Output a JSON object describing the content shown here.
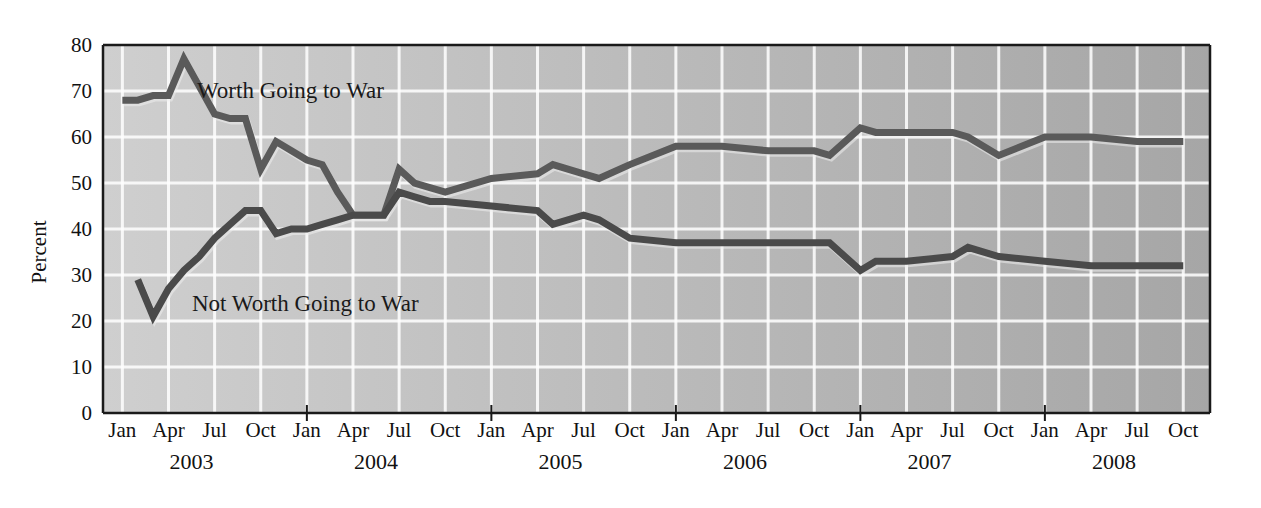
{
  "chart_data": {
    "type": "line",
    "title": "",
    "xlabel": "",
    "ylabel": "Percent",
    "ylim": [
      0,
      80
    ],
    "ytick_step": 10,
    "yticks": [
      "0",
      "10",
      "20",
      "30",
      "40",
      "50",
      "60",
      "70",
      "80"
    ],
    "grid": true,
    "grid_color": "#ffffff",
    "plot_bg_left": "#cfcfcf",
    "plot_bg_right": "#a6a6a6",
    "legend_position": "inline-annotations",
    "x": [
      "Jan 2003",
      "Feb 2003",
      "Mar 2003",
      "Apr 2003",
      "May 2003",
      "Jun 2003",
      "Jul 2003",
      "Aug 2003",
      "Sep 2003",
      "Oct 2003",
      "Nov 2003",
      "Dec 2003",
      "Jan 2004",
      "Feb 2004",
      "Mar 2004",
      "Apr 2004",
      "May 2004",
      "Jun 2004",
      "Jul 2004",
      "Aug 2004",
      "Sep 2004",
      "Oct 2004",
      "Jan 2005",
      "Apr 2005",
      "May 2005",
      "Jul 2005",
      "Aug 2005",
      "Oct 2005",
      "Jan 2006",
      "Apr 2006",
      "Jul 2006",
      "Oct 2006",
      "Nov 2006",
      "Jan 2007",
      "Feb 2007",
      "Apr 2007",
      "Jul 2007",
      "Aug 2007",
      "Oct 2007",
      "Jan 2008",
      "Apr 2008",
      "Jul 2008",
      "Oct 2008"
    ],
    "series": [
      {
        "name": "Worth Going to War",
        "color": "#5a5a5a",
        "values": [
          68,
          68,
          69,
          69,
          77,
          71,
          65,
          64,
          64,
          53,
          59,
          57,
          55,
          54,
          48,
          43,
          43,
          43,
          53,
          50,
          49,
          48,
          51,
          52,
          54,
          52,
          51,
          54,
          58,
          58,
          57,
          57,
          56,
          62,
          61,
          61,
          61,
          60,
          56,
          60,
          60,
          59,
          59
        ]
      },
      {
        "name": "Not Worth Going to War",
        "color": "#4a4a4a",
        "values": [
          null,
          29,
          21,
          27,
          31,
          34,
          38,
          41,
          44,
          44,
          39,
          40,
          40,
          41,
          42,
          43,
          43,
          43,
          48,
          47,
          46,
          46,
          45,
          44,
          41,
          43,
          42,
          38,
          37,
          37,
          37,
          37,
          37,
          31,
          33,
          33,
          34,
          36,
          34,
          33,
          32,
          32,
          32
        ]
      }
    ],
    "annotations": [
      {
        "text": "Worth Going to War",
        "x_px": 197,
        "y_px": 98
      },
      {
        "text": "Not Worth Going to War",
        "x_px": 192,
        "y_px": 311
      }
    ],
    "xaxis_groups": [
      {
        "year": "2003",
        "months": [
          "Jan",
          "Apr",
          "Jul",
          "Oct"
        ]
      },
      {
        "year": "2004",
        "months": [
          "Jan",
          "Apr",
          "Jul",
          "Oct"
        ]
      },
      {
        "year": "2005",
        "months": [
          "Jan",
          "Apr",
          "Jul",
          "Oct"
        ]
      },
      {
        "year": "2006",
        "months": [
          "Jan",
          "Apr",
          "Jul",
          "Oct"
        ]
      },
      {
        "year": "2007",
        "months": [
          "Jan",
          "Apr",
          "Jul",
          "Oct"
        ]
      },
      {
        "year": "2008",
        "months": [
          "Jan",
          "Apr",
          "Jul",
          "Oct"
        ]
      }
    ]
  }
}
